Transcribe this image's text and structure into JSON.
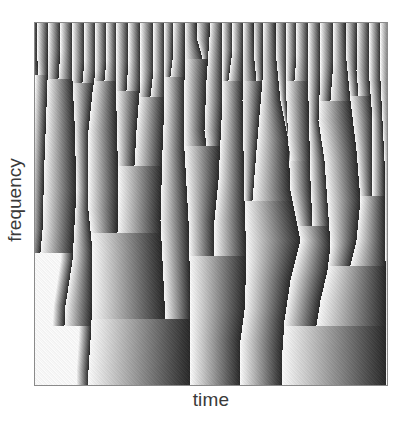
{
  "chart_data": {
    "type": "heatmap",
    "title": "",
    "xlabel": "time",
    "ylabel": "frequency",
    "x_ticks": [],
    "y_ticks": [],
    "grid": false,
    "legend": null,
    "colormap": "grayscale phase ramp (light to dark, left to right within each band)",
    "colors": {
      "light": "#f4f4f4",
      "dark": "#2a2a2a",
      "frame": "#8a8a8a"
    },
    "plot_area_px": {
      "left": 34,
      "top": 22,
      "width": 354,
      "height": 364
    },
    "boundaries": [
      [
        [
          37,
          22
        ],
        [
          37,
          60
        ],
        [
          38,
          74
        ]
      ],
      [
        [
          48,
          22
        ],
        [
          47,
          80
        ],
        [
          44,
          160
        ],
        [
          42,
          230
        ],
        [
          40,
          252
        ]
      ],
      [
        [
          60,
          22
        ],
        [
          60,
          50
        ],
        [
          58,
          78
        ]
      ],
      [
        [
          72,
          22
        ],
        [
          72,
          80
        ],
        [
          74,
          120
        ],
        [
          76,
          190
        ],
        [
          72,
          260
        ],
        [
          65,
          305
        ],
        [
          64,
          325
        ]
      ],
      [
        [
          84,
          22
        ],
        [
          84,
          60
        ],
        [
          82,
          82
        ]
      ],
      [
        [
          95,
          22
        ],
        [
          95,
          70
        ],
        [
          92,
          92
        ],
        [
          88,
          130
        ],
        [
          88,
          210
        ],
        [
          92,
          250
        ],
        [
          92,
          300
        ],
        [
          90,
          340
        ],
        [
          88,
          370
        ],
        [
          88,
          386
        ]
      ],
      [
        [
          106,
          22
        ],
        [
          106,
          60
        ],
        [
          104,
          80
        ]
      ],
      [
        [
          116,
          22
        ],
        [
          116,
          110
        ],
        [
          118,
          190
        ],
        [
          117,
          232
        ]
      ],
      [
        [
          128,
          22
        ],
        [
          128,
          60
        ],
        [
          126,
          90
        ]
      ],
      [
        [
          140,
          22
        ],
        [
          140,
          80
        ],
        [
          136,
          130
        ],
        [
          134,
          165
        ]
      ],
      [
        [
          153,
          22
        ],
        [
          153,
          70
        ],
        [
          150,
          96
        ]
      ],
      [
        [
          164,
          22
        ],
        [
          164,
          100
        ],
        [
          162,
          150
        ],
        [
          160,
          220
        ],
        [
          162,
          260
        ],
        [
          164,
          300
        ],
        [
          165,
          318
        ]
      ],
      [
        [
          173,
          22
        ],
        [
          172,
          60
        ],
        [
          170,
          76
        ]
      ],
      [
        [
          185,
          22
        ],
        [
          184,
          80
        ],
        [
          184,
          150
        ],
        [
          188,
          220
        ],
        [
          190,
          300
        ],
        [
          190,
          386
        ]
      ],
      [
        [
          196,
          22
        ],
        [
          197,
          40
        ],
        [
          202,
          58
        ]
      ],
      [
        [
          210,
          22
        ],
        [
          206,
          80
        ],
        [
          204,
          130
        ],
        [
          206,
          145
        ]
      ],
      [
        [
          222,
          22
        ],
        [
          222,
          100
        ],
        [
          218,
          180
        ],
        [
          214,
          220
        ],
        [
          214,
          255
        ]
      ],
      [
        [
          232,
          22
        ],
        [
          232,
          50
        ],
        [
          228,
          80
        ]
      ],
      [
        [
          243,
          22
        ],
        [
          242,
          100
        ],
        [
          244,
          200
        ],
        [
          246,
          260
        ],
        [
          244,
          310
        ],
        [
          240,
          340
        ],
        [
          240,
          386
        ]
      ],
      [
        [
          253,
          22
        ],
        [
          254,
          60
        ],
        [
          256,
          80
        ]
      ],
      [
        [
          263,
          22
        ],
        [
          262,
          80
        ],
        [
          256,
          150
        ],
        [
          252,
          200
        ]
      ],
      [
        [
          275,
          22
        ],
        [
          276,
          60
        ],
        [
          280,
          100
        ],
        [
          288,
          140
        ],
        [
          290,
          160
        ]
      ],
      [
        [
          286,
          22
        ],
        [
          286,
          100
        ],
        [
          290,
          190
        ],
        [
          300,
          240
        ],
        [
          290,
          280
        ],
        [
          284,
          320
        ],
        [
          282,
          350
        ],
        [
          282,
          386
        ]
      ],
      [
        [
          296,
          22
        ],
        [
          296,
          55
        ],
        [
          294,
          80
        ]
      ],
      [
        [
          308,
          22
        ],
        [
          308,
          100
        ],
        [
          310,
          180
        ],
        [
          312,
          225
        ]
      ],
      [
        [
          320,
          22
        ],
        [
          320,
          70
        ],
        [
          318,
          120
        ],
        [
          324,
          160
        ],
        [
          330,
          245
        ],
        [
          327,
          270
        ],
        [
          320,
          300
        ],
        [
          316,
          325
        ]
      ],
      [
        [
          333,
          22
        ],
        [
          333,
          60
        ],
        [
          330,
          100
        ]
      ],
      [
        [
          345,
          22
        ],
        [
          346,
          60
        ],
        [
          350,
          100
        ],
        [
          356,
          150
        ],
        [
          360,
          200
        ],
        [
          356,
          240
        ],
        [
          350,
          265
        ]
      ],
      [
        [
          357,
          22
        ],
        [
          356,
          70
        ],
        [
          358,
          95
        ]
      ],
      [
        [
          369,
          22
        ],
        [
          369,
          80
        ],
        [
          372,
          120
        ],
        [
          372,
          180
        ],
        [
          372,
          195
        ]
      ],
      [
        [
          380,
          22
        ],
        [
          380,
          80
        ],
        [
          384,
          160
        ],
        [
          385,
          260
        ],
        [
          386,
          386
        ]
      ]
    ]
  }
}
